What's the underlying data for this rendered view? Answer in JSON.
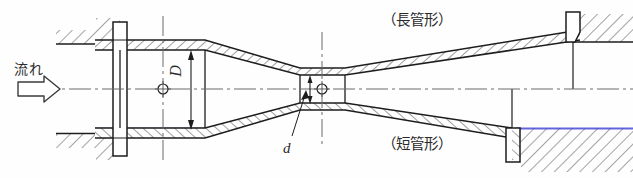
{
  "figure": {
    "kind": "venturi-tube-cross-section",
    "background_color": "#fefefe",
    "line_color": "#1d1d1d",
    "centerline_color": "#5a5a5a",
    "scan_tint_blue": "#4040d8",
    "scan_tint_orange": "#d9a23a"
  },
  "labels": {
    "flow": "流れ",
    "long_tube_type": "（長管形）",
    "short_tube_type": "（短管形）",
    "dimension_large": "D",
    "dimension_small": "d"
  },
  "icons": {
    "flow_arrow": "hollow-right-arrow",
    "center_mark": "circle-cross",
    "dimension_arrow_D": "double-headed-vertical-arrow",
    "dimension_arrow_d": "double-headed-vertical-arrow",
    "leader_line_d": "diagonal-leader-line"
  },
  "geometry": {
    "axis_y": 89,
    "inlet": {
      "x_start": 95,
      "x_end": 205,
      "wall_outer_top": 40,
      "wall_inner_top": 50,
      "wall_inner_bottom": 128,
      "wall_outer_bottom": 138
    },
    "throat": {
      "x_start": 300,
      "x_end": 345,
      "wall_inner_top": 75,
      "wall_inner_bottom": 103
    },
    "long_outlet_end_x": 580,
    "short_outlet_end_x": 512,
    "left_flange_x": 120,
    "right_flange_top_x": 572,
    "right_flange_bottom_x": 512
  }
}
